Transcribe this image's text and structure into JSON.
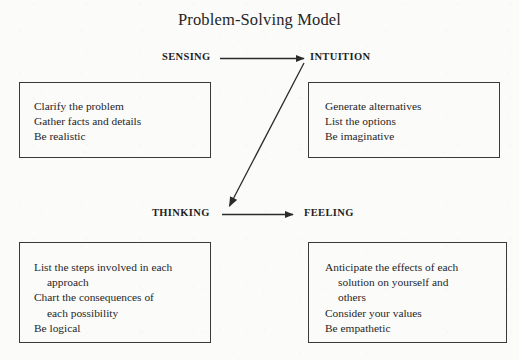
{
  "diagram": {
    "title": "Problem-Solving Model",
    "quadrant_labels": {
      "sensing": "SENSING",
      "intuition": "INTUITION",
      "thinking": "THINKING",
      "feeling": "FEELING"
    },
    "arrows": [
      {
        "name": "sensing-to-intuition",
        "from": "SENSING",
        "to": "INTUITION",
        "direction": "horizontal-right"
      },
      {
        "name": "thinking-to-feeling",
        "from": "THINKING",
        "to": "FEELING",
        "direction": "horizontal-right"
      },
      {
        "name": "intuition-to-thinking",
        "from": "INTUITION",
        "to": "THINKING",
        "direction": "diagonal-down-left"
      }
    ],
    "boxes": {
      "sensing": {
        "label": "SENSING",
        "lines": [
          {
            "text": "Clarify the problem",
            "indent": false
          },
          {
            "text": "Gather facts and details",
            "indent": false
          },
          {
            "text": "Be realistic",
            "indent": false
          }
        ]
      },
      "intuition": {
        "label": "INTUITION",
        "lines": [
          {
            "text": "Generate alternatives",
            "indent": false
          },
          {
            "text": "List the options",
            "indent": false
          },
          {
            "text": "Be imaginative",
            "indent": false
          }
        ]
      },
      "thinking": {
        "label": "THINKING",
        "lines": [
          {
            "text": "List the steps involved in each",
            "indent": false
          },
          {
            "text": "approach",
            "indent": true
          },
          {
            "text": "Chart the consequences of",
            "indent": false
          },
          {
            "text": "each possibility",
            "indent": true
          },
          {
            "text": "Be logical",
            "indent": false
          }
        ]
      },
      "feeling": {
        "label": "FEELING",
        "lines": [
          {
            "text": "Anticipate the effects of each",
            "indent": false
          },
          {
            "text": "solution on yourself and",
            "indent": true
          },
          {
            "text": "others",
            "indent": true
          },
          {
            "text": "Consider your values",
            "indent": false
          },
          {
            "text": "Be empathetic",
            "indent": false
          }
        ]
      }
    },
    "colors": {
      "ink": "#262626",
      "border": "#3a3a3a",
      "background": "#fbfbfa"
    }
  }
}
